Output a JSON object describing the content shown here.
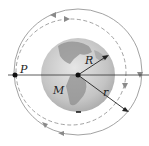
{
  "diagram": {
    "labels": {
      "point": "P",
      "mass": "M",
      "planet_radius": "R",
      "orbit_radius": "r"
    },
    "colors": {
      "orbit": "#888888",
      "line": "#333333",
      "earth_light": "#d8d8d8",
      "earth_dark": "#9a9a9a"
    }
  }
}
